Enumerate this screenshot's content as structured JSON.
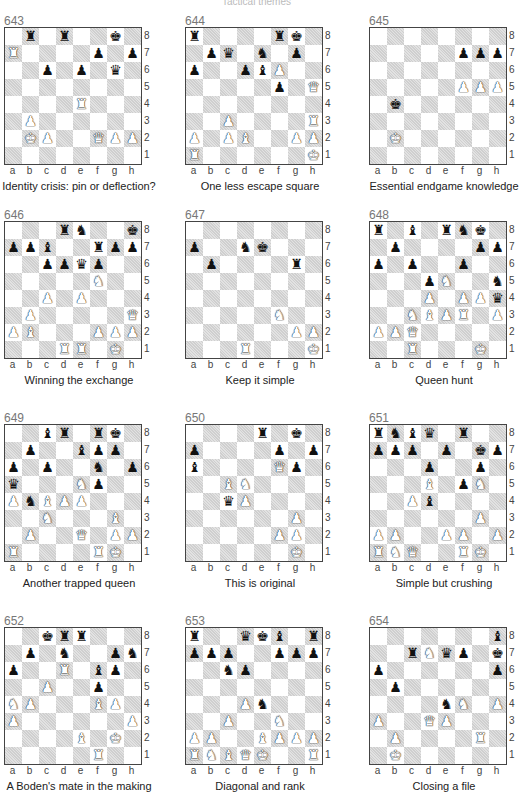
{
  "page": {
    "running_head": "Tactical themes"
  },
  "files": [
    "a",
    "b",
    "c",
    "d",
    "e",
    "f",
    "g",
    "h"
  ],
  "ranks": [
    "8",
    "7",
    "6",
    "5",
    "4",
    "3",
    "2",
    "1"
  ],
  "puzzles": [
    {
      "number": "643",
      "caption": "Identity crisis: pin or deflection?",
      "pieces": {
        "b8": "br",
        "d8": "br",
        "g8": "bk",
        "a7": "wr",
        "f7": "bp",
        "h7": "bp",
        "c6": "bp",
        "e6": "bp",
        "g6": "bq",
        "e4": "wr",
        "b3": "wp",
        "b2": "wk",
        "c2": "wp",
        "f2": "wq",
        "g2": "wp",
        "h2": "wp"
      }
    },
    {
      "number": "644",
      "caption": "One less escape square",
      "pieces": {
        "a8": "br",
        "f8": "br",
        "g8": "bk",
        "b7": "bp",
        "c7": "bq",
        "e7": "bn",
        "g7": "bp",
        "a6": "bp",
        "d6": "bp",
        "e6": "bb",
        "f6": "wp",
        "f5": "bp",
        "h5": "wq",
        "c3": "wp",
        "h3": "wr",
        "a2": "wp",
        "c2": "wp",
        "d2": "wb",
        "g2": "wp",
        "h2": "wp",
        "a1": "wr",
        "h1": "wk"
      }
    },
    {
      "number": "645",
      "caption": "Essential endgame knowledge",
      "pieces": {
        "f7": "bp",
        "g7": "bp",
        "h7": "bp",
        "f5": "wp",
        "g5": "wp",
        "h5": "wp",
        "b4": "bk",
        "b2": "wk"
      }
    },
    {
      "number": "646",
      "caption": "Winning the exchange",
      "pieces": {
        "d8": "br",
        "e8": "bn",
        "h8": "bk",
        "a7": "bp",
        "b7": "bp",
        "c7": "bb",
        "f7": "br",
        "g7": "bp",
        "h7": "bp",
        "c6": "bp",
        "d6": "bp",
        "e6": "bq",
        "f6": "bp",
        "f5": "wn",
        "c4": "wp",
        "e4": "wp",
        "b3": "wp",
        "h3": "wq",
        "a2": "wp",
        "b2": "wb",
        "f2": "wp",
        "g2": "wp",
        "h2": "wp",
        "d1": "wr",
        "e1": "wr",
        "g1": "wk"
      }
    },
    {
      "number": "647",
      "caption": "Keep it simple",
      "pieces": {
        "a7": "bp",
        "d7": "bn",
        "e7": "bk",
        "b6": "bp",
        "g6": "br",
        "f3": "wn",
        "g2": "wp",
        "h2": "wp",
        "d1": "wr",
        "h1": "wk"
      }
    },
    {
      "number": "648",
      "caption": "Queen hunt",
      "pieces": {
        "a8": "br",
        "c8": "bb",
        "e8": "br",
        "f8": "bn",
        "g8": "bk",
        "b7": "bp",
        "g7": "bp",
        "h7": "bp",
        "a6": "bp",
        "c6": "bp",
        "f6": "bp",
        "d5": "bp",
        "e5": "wn",
        "h5": "bn",
        "d4": "wp",
        "f4": "wp",
        "g4": "wp",
        "h4": "bq",
        "c3": "wn",
        "d3": "wb",
        "e3": "wp",
        "f3": "wr",
        "h3": "wp",
        "a2": "wp",
        "b2": "wp",
        "c2": "wq",
        "c1": "wr",
        "g1": "wk"
      }
    },
    {
      "number": "649",
      "caption": "Another trapped queen",
      "pieces": {
        "c8": "bb",
        "d8": "br",
        "f8": "br",
        "g8": "bk",
        "b7": "bp",
        "e7": "bb",
        "f7": "bp",
        "g7": "bp",
        "a6": "bp",
        "c6": "bp",
        "f6": "bn",
        "h6": "bp",
        "a5": "bq",
        "e5": "wn",
        "f5": "bp",
        "a4": "wp",
        "b4": "bn",
        "c4": "wb",
        "d4": "wp",
        "e4": "wp",
        "c3": "wn",
        "g3": "wb",
        "b2": "wp",
        "e2": "wq",
        "g2": "wp",
        "h2": "wp",
        "a1": "wr",
        "f1": "wr",
        "g1": "wk"
      }
    },
    {
      "number": "650",
      "caption": "This is original",
      "pieces": {
        "e8": "br",
        "g8": "bk",
        "a7": "bp",
        "f7": "bp",
        "h7": "bp",
        "a6": "bb",
        "f6": "wq",
        "g6": "bp",
        "c5": "wb",
        "d5": "wn",
        "c4": "bq",
        "d4": "wp",
        "g3": "wp",
        "f2": "wp",
        "g2": "wp",
        "g1": "wk"
      }
    },
    {
      "number": "651",
      "caption": "Simple but crushing",
      "pieces": {
        "a8": "br",
        "b8": "bn",
        "c8": "bb",
        "d8": "bq",
        "f8": "br",
        "a7": "bp",
        "b7": "bp",
        "c7": "bp",
        "e7": "bp",
        "g7": "bk",
        "h7": "bp",
        "d6": "bp",
        "g6": "bp",
        "d5": "wb",
        "f5": "bp",
        "g5": "wn",
        "c4": "wp",
        "d4": "bb",
        "g3": "wp",
        "a2": "wp",
        "b2": "wp",
        "e2": "wp",
        "f2": "wp",
        "h2": "wp",
        "a1": "wr",
        "b1": "wn",
        "c1": "wq",
        "f1": "wr",
        "g1": "wk"
      }
    },
    {
      "number": "652",
      "caption": "A Boden's mate in the making",
      "pieces": {
        "c8": "bk",
        "d8": "br",
        "e8": "br",
        "b7": "bp",
        "d7": "bn",
        "g7": "bp",
        "h7": "bn",
        "a6": "bp",
        "d6": "wr",
        "f6": "bb",
        "g6": "bp",
        "c5": "wp",
        "f5": "bp",
        "a4": "wn",
        "b4": "wp",
        "f4": "wb",
        "g4": "wp",
        "a3": "wp",
        "h3": "wp",
        "e2": "wb",
        "g2": "wk",
        "f1": "wr"
      }
    },
    {
      "number": "653",
      "caption": "Diagonal and rank",
      "pieces": {
        "a8": "br",
        "d8": "bq",
        "e8": "bk",
        "f8": "bb",
        "h8": "br",
        "a7": "bp",
        "b7": "bp",
        "c7": "bp",
        "f7": "bp",
        "g7": "bp",
        "h7": "bp",
        "c6": "bn",
        "d6": "bp",
        "d4": "wp",
        "e4": "bn",
        "c3": "wp",
        "f3": "wn",
        "a2": "wp",
        "b2": "wp",
        "e2": "wb",
        "f2": "wp",
        "g2": "wp",
        "h2": "wp",
        "a1": "wr",
        "b1": "wn",
        "c1": "wb",
        "d1": "wq",
        "e1": "wk",
        "h1": "wr"
      }
    },
    {
      "number": "654",
      "caption": "Closing a file",
      "pieces": {
        "h8": "bb",
        "c7": "br",
        "d7": "wn",
        "e7": "bq",
        "f7": "bp",
        "h7": "bk",
        "a6": "bp",
        "h6": "bp",
        "b5": "bp",
        "e4": "bn",
        "f4": "wn",
        "h4": "wp",
        "a3": "wp",
        "d3": "wq",
        "e3": "wp",
        "b2": "wp",
        "g2": "wr",
        "b1": "wk"
      }
    }
  ],
  "glyphs": {
    "k": "♚",
    "q": "♛",
    "r": "♜",
    "b": "♝",
    "n": "♞",
    "p": "♟"
  }
}
